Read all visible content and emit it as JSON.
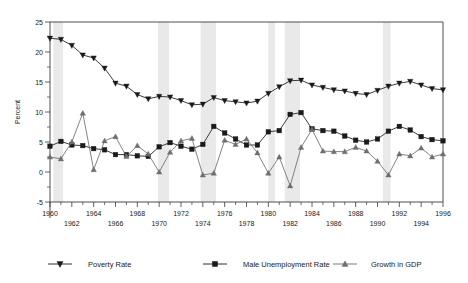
{
  "chart_data": {
    "type": "line",
    "title": "",
    "xlabel": "",
    "ylabel": "Percent",
    "xlim": [
      1960,
      1996
    ],
    "ylim": [
      -5,
      25
    ],
    "ytick_step": 5,
    "yticks": [
      -5,
      0,
      5,
      10,
      15,
      20,
      25
    ],
    "ytick_labels": [
      "-5",
      "0",
      "5",
      "10",
      "15",
      "20",
      "25"
    ],
    "yminor_step": 2.5,
    "grid": false,
    "legend_position": "bottom",
    "x": [
      1960,
      1961,
      1962,
      1963,
      1964,
      1965,
      1966,
      1967,
      1968,
      1969,
      1970,
      1971,
      1972,
      1973,
      1974,
      1975,
      1976,
      1977,
      1978,
      1979,
      1980,
      1981,
      1982,
      1983,
      1984,
      1985,
      1986,
      1987,
      1988,
      1989,
      1990,
      1991,
      1992,
      1993,
      1994,
      1995,
      1996
    ],
    "xticks_top": [
      1960,
      1964,
      1968,
      1972,
      1976,
      1980,
      1984,
      1988,
      1992,
      1996
    ],
    "xticks_bottom": [
      1962,
      1966,
      1970,
      1974,
      1978,
      1982,
      1986,
      1990,
      1994
    ],
    "xtick_top_labels": [
      "1960",
      "1964",
      "1968",
      "1972",
      "1976",
      "1980",
      "1984",
      "1988",
      "1992",
      "1996"
    ],
    "xtick_bottom_labels": [
      "1962",
      "1966",
      "1970",
      "1974",
      "1978",
      "1982",
      "1986",
      "1990",
      "1994"
    ],
    "recession_bands": [
      {
        "start": 1960.3,
        "end": 1961.2
      },
      {
        "start": 1969.9,
        "end": 1970.9
      },
      {
        "start": 1973.8,
        "end": 1975.2
      },
      {
        "start": 1980.0,
        "end": 1980.6
      },
      {
        "start": 1981.5,
        "end": 1982.9
      },
      {
        "start": 1990.5,
        "end": 1991.2
      }
    ],
    "series": [
      {
        "name": "Poverty Rate",
        "marker": "triangle-down",
        "color": "#1a1a1a",
        "values": [
          22.3,
          22.1,
          21.1,
          19.5,
          19.0,
          17.3,
          14.8,
          14.3,
          12.9,
          12.2,
          12.6,
          12.5,
          11.9,
          11.2,
          11.3,
          12.4,
          11.9,
          11.7,
          11.5,
          11.8,
          13.1,
          14.2,
          15.2,
          15.3,
          14.5,
          14.1,
          13.7,
          13.5,
          13.1,
          12.9,
          13.6,
          14.3,
          14.8,
          15.1,
          14.5,
          13.9,
          13.7
        ]
      },
      {
        "name": "Male Unemployment Rate",
        "marker": "square",
        "color": "#1a1a1a",
        "values": [
          4.3,
          5.1,
          4.5,
          4.4,
          3.9,
          3.7,
          2.9,
          2.9,
          2.7,
          2.6,
          4.2,
          4.9,
          4.3,
          3.8,
          4.6,
          7.6,
          6.5,
          5.5,
          4.5,
          4.5,
          6.7,
          6.9,
          9.6,
          9.9,
          7.2,
          6.9,
          6.8,
          6.0,
          5.3,
          5.0,
          5.5,
          6.8,
          7.6,
          7.0,
          5.9,
          5.4,
          5.2
        ]
      },
      {
        "name": "Growth in GDP",
        "marker": "triangle-up",
        "color": "#6e6e6e",
        "values": [
          2.5,
          2.2,
          5.0,
          9.8,
          0.4,
          5.2,
          5.9,
          2.6,
          4.4,
          3.0,
          0.0,
          3.3,
          5.2,
          5.6,
          -0.5,
          -0.2,
          5.3,
          4.6,
          5.5,
          3.2,
          -0.2,
          2.5,
          -2.3,
          4.1,
          7.1,
          3.5,
          3.4,
          3.4,
          4.1,
          3.5,
          1.8,
          -0.5,
          3.0,
          2.7,
          4.0,
          2.5,
          3.0
        ]
      }
    ],
    "legend": [
      {
        "label": "Poverty Rate",
        "marker": "triangle-down",
        "color": "#1a1a1a"
      },
      {
        "label": "Male Unemployment Rate",
        "marker": "square",
        "color": "#1a1a1a"
      },
      {
        "label": "Growth in GDP",
        "marker": "triangle-up",
        "color": "#6e6e6e"
      }
    ]
  }
}
